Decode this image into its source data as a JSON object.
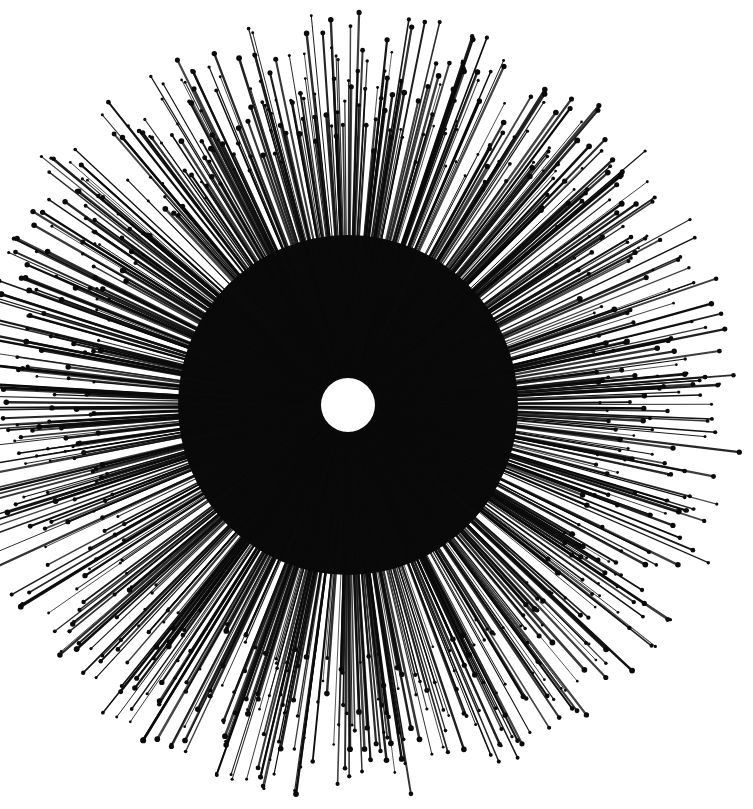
{
  "artwork": {
    "subject": "ink starburst drawing",
    "background": "#ffffff",
    "ink": "#0a0a0a",
    "center": {
      "x": 348,
      "y": 405
    },
    "hole_radius": 27,
    "inner_radius": 30,
    "outer_radius_min": 250,
    "outer_radius_max": 395,
    "ray_count": 900,
    "seed": 7
  }
}
